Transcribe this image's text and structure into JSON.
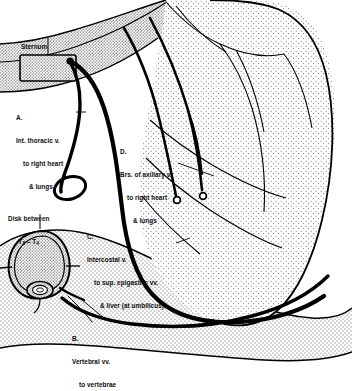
{
  "figure": {
    "type": "anatomical-line-diagram",
    "view": "oblique left anterolateral thorax with vertebral cross-section",
    "background_color": "#ffffff",
    "ink_color": "#000000",
    "stipple_color": "#6e6e6e"
  },
  "labels": {
    "sternum": {
      "name": "Sternum",
      "lines": [
        "Sternum"
      ]
    },
    "disk": {
      "name": "Disk between T3-T4",
      "lines": [
        "Disk between",
        "T3 – T4"
      ],
      "line1": "Disk between",
      "vertebra_upper": "T",
      "vertebra_upper_sub": "3",
      "dash": " – ",
      "vertebra_lower": "T",
      "vertebra_lower_sub": "4"
    },
    "a": {
      "key": "A.",
      "lines": [
        "A.",
        "Int. thoracic v.",
        "to right heart",
        "& lungs"
      ],
      "line0": "A.",
      "line1": "Int. thoracic v.",
      "line2": "to right heart",
      "line3": "& lungs"
    },
    "b": {
      "key": "B.",
      "lines": [
        "B.",
        "Vertebral vv.",
        "to vertebrae"
      ],
      "line0": "B.",
      "line1": "Vertebral vv.",
      "line2": "to vertebrae"
    },
    "c": {
      "key": "C.",
      "lines": [
        "C.",
        "Intercostal v.",
        "to sup. epigastric vv.",
        "& liver (at umbilicus)"
      ],
      "line0": "C.",
      "line1": "Intercostal v.",
      "line2": "to sup. epigastric vv.",
      "line3": "& liver (at umbilicus)"
    },
    "d": {
      "key": "D.",
      "lines": [
        "D.",
        "Brs. of axillary v.",
        "to right heart",
        "& lungs"
      ],
      "line0": "D.",
      "line1": "Brs. of axillary v.",
      "line2": "to right heart",
      "line3": "& lungs"
    }
  },
  "structures": [
    {
      "id": "sternum-box",
      "name": "sternum"
    },
    {
      "id": "vertebra",
      "name": "vertebral body cross-section (T3-T4 disk)"
    },
    {
      "id": "spinal-canal",
      "name": "vertebral canal / spinal cord"
    },
    {
      "id": "torso",
      "name": "thoracic wall and shoulder silhouette"
    },
    {
      "id": "int-thoracic-vein",
      "name": "internal thoracic vein"
    },
    {
      "id": "intercostal-vein",
      "name": "intercostal vein loop"
    },
    {
      "id": "vertebral-veins",
      "name": "vertebral veins"
    },
    {
      "id": "axillary-branches",
      "name": "branches of axillary vein"
    }
  ]
}
